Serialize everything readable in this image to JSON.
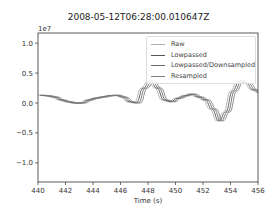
{
  "title": "2008-05-12T06:28:00.010647Z",
  "chart_data": {
    "type": "line",
    "title": "2008-05-12T06:28:00.010647Z",
    "xlabel": "Time (s)",
    "ylabel": "",
    "y_scale_label": "1e7",
    "xlim": [
      440,
      456
    ],
    "ylim": [
      -1.32,
      1.17
    ],
    "xticks": [
      440,
      442,
      444,
      446,
      448,
      450,
      452,
      454,
      456
    ],
    "xtick_labels": [
      "440",
      "442",
      "444",
      "446",
      "448",
      "450",
      "452",
      "454",
      "456"
    ],
    "yticks": [
      1.0,
      0.5,
      0.0,
      -0.5,
      -1.0
    ],
    "ytick_labels": [
      "1.0",
      "0.5",
      "0.0",
      "−0.5",
      "−1.0"
    ],
    "grid": false,
    "legend_position": "upper right",
    "legend": [
      "Raw",
      "Lowpassed",
      "Lowpassed/Downsampled",
      "Resampled"
    ],
    "x": [
      440.0,
      440.5,
      441.0,
      441.5,
      442.0,
      442.5,
      443.0,
      443.5,
      444.0,
      444.5,
      445.0,
      445.5,
      446.0,
      446.5,
      447.0,
      447.5,
      448.0,
      448.5,
      449.0,
      449.5,
      450.0,
      450.5,
      451.0,
      451.5,
      452.0,
      452.5,
      453.0,
      453.5,
      454.0,
      454.5,
      455.0,
      455.5,
      456.0
    ],
    "series": [
      {
        "name": "Raw",
        "color": "#b0b0b0",
        "shift": 0.0,
        "values": [
          0.13,
          0.12,
          0.1,
          0.05,
          0.02,
          0.0,
          0.0,
          0.05,
          0.08,
          0.1,
          0.12,
          0.13,
          0.1,
          0.02,
          0.0,
          0.25,
          0.37,
          0.25,
          0.05,
          0.02,
          0.08,
          0.12,
          0.15,
          0.1,
          0.05,
          -0.1,
          -0.3,
          -0.15,
          0.2,
          0.37,
          0.33,
          0.22,
          0.17
        ]
      },
      {
        "name": "Lowpassed",
        "color": "#555555",
        "shift": 0.15,
        "values": [
          0.13,
          0.12,
          0.1,
          0.05,
          0.02,
          0.0,
          0.0,
          0.05,
          0.08,
          0.1,
          0.12,
          0.13,
          0.1,
          0.02,
          0.0,
          0.25,
          0.37,
          0.25,
          0.05,
          0.02,
          0.08,
          0.12,
          0.15,
          0.1,
          0.05,
          -0.1,
          -0.3,
          -0.15,
          0.2,
          0.37,
          0.33,
          0.22,
          0.17
        ]
      },
      {
        "name": "Lowpassed/Downsampled",
        "color": "#6a6a6a",
        "shift": 0.3,
        "values": [
          0.13,
          0.12,
          0.1,
          0.05,
          0.02,
          0.0,
          0.0,
          0.05,
          0.08,
          0.1,
          0.12,
          0.13,
          0.1,
          0.02,
          0.0,
          0.25,
          0.37,
          0.25,
          0.05,
          0.02,
          0.08,
          0.12,
          0.15,
          0.1,
          0.05,
          -0.1,
          -0.3,
          -0.15,
          0.2,
          0.37,
          0.33,
          0.22,
          0.17
        ]
      },
      {
        "name": "Resampled",
        "color": "#808080",
        "shift": 0.45,
        "values": [
          0.13,
          0.12,
          0.1,
          0.05,
          0.02,
          0.0,
          0.0,
          0.05,
          0.08,
          0.1,
          0.12,
          0.13,
          0.1,
          0.02,
          0.0,
          0.25,
          0.37,
          0.25,
          0.05,
          0.02,
          0.08,
          0.12,
          0.15,
          0.1,
          0.05,
          -0.1,
          -0.3,
          -0.15,
          0.2,
          0.37,
          0.33,
          0.22,
          0.17
        ]
      }
    ]
  }
}
